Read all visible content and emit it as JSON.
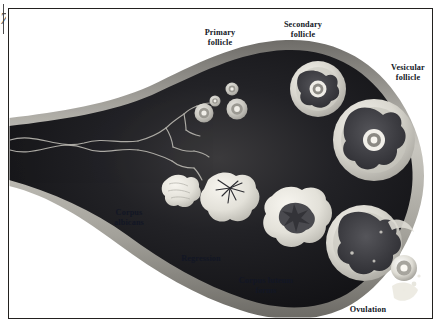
{
  "figure": {
    "artifact_glyph": "7",
    "background_color": "#ffffff",
    "frame_color": "#23211f",
    "label_color": "#121624",
    "stroma_dark_color": "#15161b",
    "cortex_band_color": "#9c9a95",
    "follicle_fill_color": "#e8e6df",
    "vessel_color": "#b9b7b0"
  },
  "labels": [
    {
      "id": "primary-follicle",
      "text": "Primary\nfollicle",
      "x": 188,
      "y": 28,
      "w": 64
    },
    {
      "id": "secondary-follicle",
      "text": "Secondary\nfollicle",
      "x": 268,
      "y": 20,
      "w": 70
    },
    {
      "id": "vesicular-follicle",
      "text": "Vesicular\nfollicle",
      "x": 377,
      "y": 63,
      "w": 62
    },
    {
      "id": "corpus-albicans",
      "text": "Corpus\nalbicans",
      "x": 98,
      "y": 208,
      "w": 62
    },
    {
      "id": "regression",
      "text": "Regression",
      "x": 168,
      "y": 254,
      "w": 66
    },
    {
      "id": "corpus-luteum-forms",
      "text": "Corpus luteum\nforms",
      "x": 222,
      "y": 276,
      "w": 88
    },
    {
      "id": "ovulation",
      "text": "Ovulation",
      "x": 337,
      "y": 305,
      "w": 62
    }
  ],
  "structures": {
    "primary_follicles": [
      {
        "cx": 204,
        "cy": 113,
        "r": 9.5
      },
      {
        "cx": 215,
        "cy": 101,
        "r": 5.5
      },
      {
        "cx": 232,
        "cy": 89,
        "r": 6.5
      },
      {
        "cx": 237,
        "cy": 109,
        "r": 10.5
      }
    ],
    "secondary_follicle": {
      "cx": 318,
      "cy": 89,
      "r": 28
    },
    "vesicular_follicle": {
      "cx": 374,
      "cy": 140,
      "r": 41
    },
    "ruptured_follicle": {
      "cx": 364,
      "cy": 243,
      "r": 38
    },
    "released_oocyte": {
      "cx": 404,
      "cy": 268,
      "r": 13
    },
    "corpus_luteum": {
      "cx": 294,
      "cy": 218,
      "r": 31
    },
    "regressing_luteum": {
      "cx": 228,
      "cy": 196,
      "r": 26
    },
    "corpus_albicans": {
      "cx": 178,
      "cy": 191,
      "r": 17
    }
  }
}
